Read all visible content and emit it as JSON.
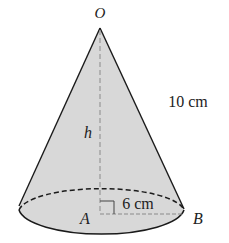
{
  "figure": {
    "type": "right circular cone",
    "apex_label": "O",
    "center_label": "A",
    "rim_label": "B",
    "height_label": "h",
    "radius_label": "6 cm",
    "slant_label": "10 cm",
    "colors": {
      "fill": "#d8d8d8",
      "stroke": "#1a1a1a",
      "dashed": "#8a8a8a"
    }
  }
}
